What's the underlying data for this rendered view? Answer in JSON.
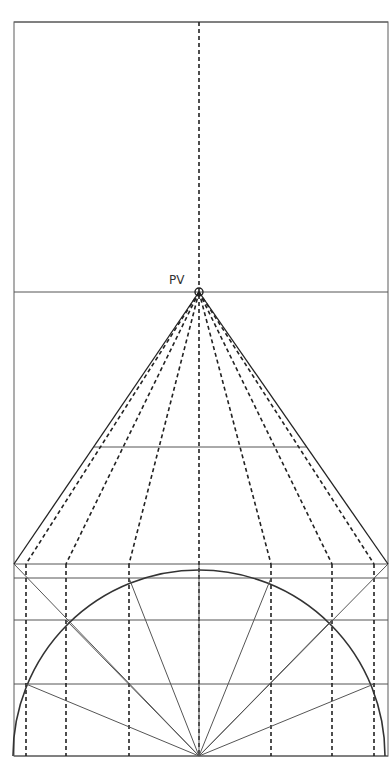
{
  "diagram": {
    "title": "",
    "labels": {
      "vanishing_point": "PV"
    },
    "colors": {
      "background": "#ffffff",
      "frame": "#777777",
      "lines": "#555555",
      "dashed": "#222222",
      "arc": "#333333"
    },
    "frame": {
      "x1": 14,
      "y1": 22,
      "x2": 388,
      "y2": 756
    },
    "vanishing_point": {
      "x": 199,
      "y": 292
    },
    "horizontals": [
      22,
      292,
      447,
      564,
      578,
      620,
      684,
      756
    ],
    "dashed_verticals": [
      26,
      66,
      129,
      199,
      271,
      332,
      374
    ],
    "semicircle": {
      "cx": 199,
      "cy": 756,
      "r": 186
    },
    "radial_points": [
      {
        "x": 26,
        "y": 684
      },
      {
        "x": 66,
        "y": 620
      },
      {
        "x": 129,
        "y": 578
      },
      {
        "x": 199,
        "y": 564
      },
      {
        "x": 271,
        "y": 578
      },
      {
        "x": 332,
        "y": 620
      },
      {
        "x": 374,
        "y": 684
      }
    ]
  }
}
